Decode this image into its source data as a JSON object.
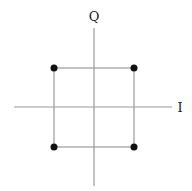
{
  "diagram": {
    "axes": {
      "horizontal": {
        "label": "I",
        "x1": 14,
        "x2": 172,
        "y": 107
      },
      "vertical": {
        "label": "Q",
        "x": 94,
        "y1": 28,
        "y2": 186
      },
      "origin": {
        "x": 94,
        "y": 107
      },
      "color": "#9a9a9a"
    },
    "box": {
      "left": 54,
      "top": 68,
      "right": 134,
      "bottom": 147,
      "color": "#9a9a9a"
    },
    "points": [
      {
        "name": "top-left",
        "i": -1,
        "q": 1,
        "x": 54,
        "y": 68
      },
      {
        "name": "top-right",
        "i": 1,
        "q": 1,
        "x": 134,
        "y": 68
      },
      {
        "name": "bottom-left",
        "i": -1,
        "q": -1,
        "x": 54,
        "y": 147
      },
      {
        "name": "bottom-right",
        "i": 1,
        "q": -1,
        "x": 134,
        "y": 147
      }
    ],
    "point_color": "#111111",
    "point_radius": 3.5,
    "labels": {
      "i": {
        "text": "I",
        "x": 180,
        "y": 112
      },
      "q": {
        "text": "Q",
        "x": 94,
        "y": 21
      }
    }
  }
}
